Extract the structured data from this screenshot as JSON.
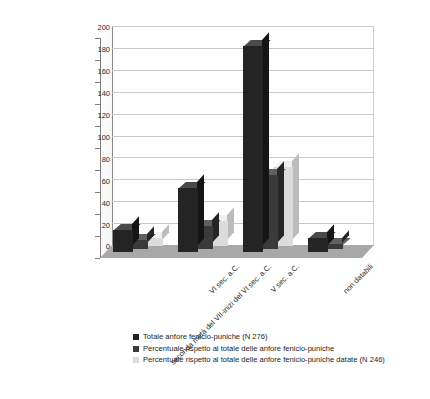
{
  "chart_data": {
    "type": "bar",
    "title": "",
    "subtitle": "",
    "xlabel": "",
    "ylabel": "",
    "ylim": [
      0,
      200
    ],
    "ytick_step": 20,
    "yticks": [
      0,
      20,
      40,
      60,
      80,
      100,
      120,
      140,
      160,
      180,
      200
    ],
    "grid": true,
    "grid_axis": "y",
    "legend_position": "bottom-left",
    "style": "3d-clustered-column",
    "categories": [
      "seconda metà del VII-inizi del VI sec. a.C.",
      "VI sec. a.C.",
      "V sec. a.C.",
      "non databili"
    ],
    "series": [
      {
        "name": "Totale anfore fenicio-puniche (N 276)",
        "color": "#242424",
        "values": [
          20,
          58,
          188,
          13
        ]
      },
      {
        "name": "Percentuale rispetto al totale delle anfore fenicio-puniche",
        "color": "#3a3a3a",
        "values": [
          8,
          21,
          68,
          5
        ]
      },
      {
        "name": "Percentuale rispetto al totale delle anfore fenicio-puniche datate (N 246)",
        "color": "#dcdcdc",
        "values": [
          7,
          23,
          72,
          0
        ]
      }
    ]
  },
  "legend": {
    "items": [
      "Totale anfore fenicio-puniche (N 276)",
      "Percentuale rispetto al totale delle anfore fenicio-puniche",
      "Percentuale rispetto al totale delle anfore fenicio-puniche datate (N 246)"
    ]
  },
  "caption": {
    "text": ""
  }
}
